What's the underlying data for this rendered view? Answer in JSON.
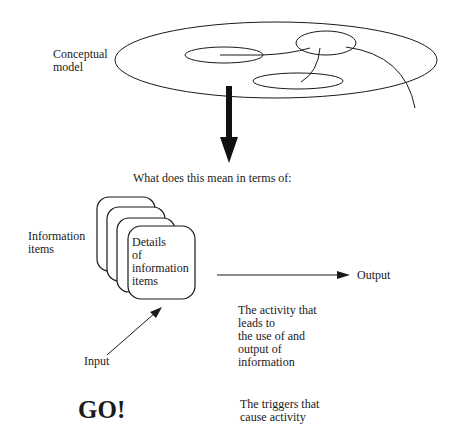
{
  "labels": {
    "conceptual_model": "Conceptual\nmodel",
    "question": "What does this mean in terms of:",
    "information_items": "Information\nitems",
    "details": "Details\nof\ninformation\nitems",
    "output": "Output",
    "input": "Input",
    "activity": "The activity that\nleads to\nthe use of and\noutput of\ninformation",
    "go": "GO!",
    "triggers": "The triggers that\ncause activity"
  },
  "colors": {
    "line": "#1a1a1a",
    "background": "#ffffff"
  }
}
